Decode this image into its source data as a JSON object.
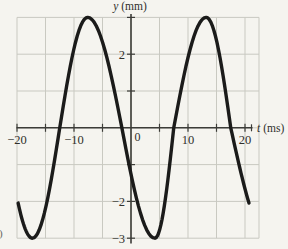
{
  "figure": {
    "corner_fragment": ")"
  },
  "chart_data": {
    "type": "line",
    "title": "",
    "xlabel_var": "t",
    "xlabel_unit": "(ms)",
    "ylabel_var": "y",
    "ylabel_unit": "(mm)",
    "xlim": [
      -20,
      20
    ],
    "ylim": [
      -3,
      3
    ],
    "grid": true,
    "x_grid_step": 5,
    "y_grid_step": 1,
    "x_tick_step": 5,
    "y_tick_step": 1,
    "x_tick_labels": [
      {
        "value": -20,
        "label": "−20"
      },
      {
        "value": -10,
        "label": "−10"
      },
      {
        "value": 10,
        "label": "10"
      },
      {
        "value": 20,
        "label": "20"
      }
    ],
    "origin_label": "0",
    "y_tick_labels": [
      {
        "value": 2,
        "label": "2"
      },
      {
        "value": -2,
        "label": "−2"
      },
      {
        "value": -3,
        "label": "−3"
      }
    ],
    "wave": {
      "shape": "sinusoid",
      "amplitude_mm": 3,
      "period_ms": 20,
      "peaks_t_ms": [
        -7.6,
        13.2
      ],
      "troughs_t_ms": [
        -17.3,
        4.2
      ],
      "zero_crossings_t_ms": [
        -12.5,
        -1.6,
        7.5,
        17.5
      ],
      "endpoints": [
        {
          "t_ms": -19.8,
          "y_mm": -2.05
        },
        {
          "t_ms": 20.7,
          "y_mm": -2.05
        }
      ],
      "phase_anchors_t_deg": [
        [
          -19.8,
          -137
        ],
        [
          -17.3,
          -90
        ],
        [
          -12.5,
          0
        ],
        [
          -7.6,
          90
        ],
        [
          -1.6,
          180
        ],
        [
          4.2,
          270
        ],
        [
          7.5,
          360
        ],
        [
          13.2,
          450
        ],
        [
          17.5,
          540
        ],
        [
          20.7,
          583
        ]
      ]
    },
    "colors": {
      "background": "#f5f4ef",
      "grid": "#c9c9c1",
      "axis": "#3c3c38",
      "curve": "#1b1b1a",
      "text": "#2f2f2b"
    }
  }
}
